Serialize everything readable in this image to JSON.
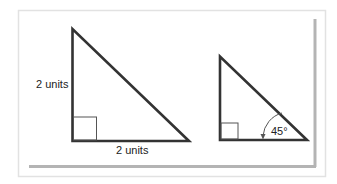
{
  "figure": {
    "colors": {
      "stroke": "#333333",
      "frame": "#e4e4e4",
      "shadow": "#b0b0b0",
      "background": "#ffffff"
    },
    "large_triangle": {
      "vertical_side_label": "2 units",
      "horizontal_side_label": "2 units",
      "right_angle_marker": true
    },
    "small_triangle": {
      "angle_label": "45°",
      "right_angle_marker": true
    }
  }
}
